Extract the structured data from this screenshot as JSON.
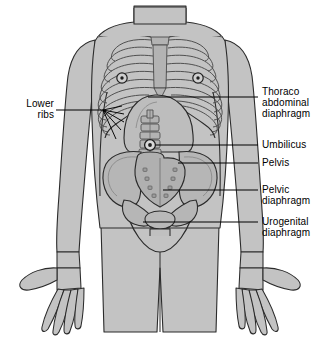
{
  "figure": {
    "background_color": "#ffffff",
    "body_fill_color": "#c3c3c3",
    "body_inner_fill_color": "#b9b9b9",
    "bone_fill_color": "#b0b0b0",
    "outline_color": "#2b2b2b",
    "label_color": "#000000"
  },
  "labels": {
    "lower_ribs": {
      "text": "Lower\nribs",
      "side": "left",
      "leader_from_x": 103,
      "leader_from_y": 110,
      "leader_to_x": 56,
      "leader_to_y": 110
    },
    "thoraco_abdominal_diaphragm": {
      "text": "Thoraco\nabdominal\ndiaphragm",
      "side": "right",
      "leader_from_x": 148,
      "leader_from_y": 97,
      "leader_to_x": 258,
      "leader_to_y": 97
    },
    "umbilicus": {
      "text": "Umbilicus",
      "side": "right",
      "leader_from_x": 150,
      "leader_from_y": 145,
      "leader_to_x": 258,
      "leader_to_y": 145
    },
    "pelvis": {
      "text": "Pelvis",
      "side": "right",
      "leader_from_x": 178,
      "leader_from_y": 163,
      "leader_to_x": 258,
      "leader_to_y": 163
    },
    "pelvic_diaphragm": {
      "text": "Pelvic\ndiaphragm",
      "side": "right",
      "leader_from_x": 163,
      "leader_from_y": 190,
      "leader_to_x": 258,
      "leader_to_y": 190
    },
    "urogenital_diaphragm": {
      "text": "Urogenital\ndiaphragm",
      "side": "right",
      "leader_from_x": 143,
      "leader_from_y": 222,
      "leader_to_x": 258,
      "leader_to_y": 222
    }
  },
  "anatomy": {
    "parts": [
      "head-neck",
      "shoulders",
      "torso",
      "left-arm",
      "right-arm",
      "left-hand",
      "right-hand",
      "legs",
      "clavicles",
      "sternum",
      "ribcage",
      "nipple-left",
      "nipple-right",
      "diaphragm-dome",
      "lumbar-spine",
      "umbilicus-marker",
      "pelvis-ilium-left",
      "pelvis-ilium-right",
      "sacrum",
      "pubic-rami",
      "pelvic-floor"
    ],
    "rib_pair_count": 10,
    "sacral_foramina_count": 8
  }
}
